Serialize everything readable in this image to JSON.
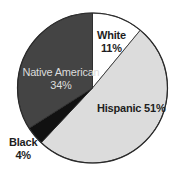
{
  "chart_data": {
    "type": "pie",
    "title": "",
    "start_angle_deg": 0,
    "direction": "clockwise",
    "slices": [
      {
        "name": "White",
        "value": 11,
        "label": "White",
        "pct_label": "11%",
        "color": "#ffffff",
        "text_color": "#1e1e1e"
      },
      {
        "name": "Hispanic",
        "value": 51,
        "label": "Hispanic 51%",
        "pct_label": "",
        "color": "#dcdcdc",
        "text_color": "#1e1e1e"
      },
      {
        "name": "Black",
        "value": 4,
        "label": "Black",
        "pct_label": "4%",
        "color": "#111111",
        "text_color": "#1e1e1e"
      },
      {
        "name": "Native American",
        "value": 34,
        "label": "Native American",
        "pct_label": "34%",
        "color": "#444444",
        "text_color": "#dcdcdc"
      }
    ],
    "categories": [
      "White",
      "Hispanic",
      "Black",
      "Native American"
    ],
    "values": [
      11,
      51,
      4,
      34
    ],
    "legend": "none",
    "outline_color": "#2a2a2a"
  }
}
